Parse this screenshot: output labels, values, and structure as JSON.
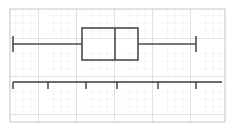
{
  "figure": {
    "kind": "box-and-whisker-plot-on-graph-paper",
    "width": 235,
    "height": 130,
    "background_color": "#ffffff"
  },
  "grid": {
    "minor_color": "#dfe4ea",
    "major_color": "#b9c2cc",
    "minor_step_px": 7.6,
    "major_every": 5,
    "left_px": 10,
    "top_px": 9,
    "right_px": 225,
    "bottom_px": 122,
    "visible": true
  },
  "chart_data": {
    "type": "box",
    "title": "",
    "subtitle": "",
    "xlabel": "",
    "ylabel": "",
    "orientation": "horizontal",
    "grid": true,
    "legend": null,
    "axis": {
      "line_y_px": 82,
      "start_px": 13,
      "end_px": 222,
      "tick_positions_px": [
        13,
        48,
        86,
        117,
        158,
        196
      ],
      "tick_labels": [
        "",
        "",
        "",
        "",
        "",
        ""
      ],
      "tick_length_px": 7,
      "color": "#3a3a3a"
    },
    "series": [
      {
        "name": "box-plot-1",
        "five_number_summary": {
          "minimum_px": 13,
          "q1_px": 82,
          "median_px": 115,
          "q3_px": 138,
          "maximum_px": 196
        },
        "box": {
          "top_px": 28,
          "bottom_px": 60,
          "center_y_px": 44
        },
        "whisker_cap": {
          "top_px": 36,
          "bottom_px": 52
        },
        "stroke_color": "#4a4a50",
        "stroke_width_px": 1.6
      }
    ]
  },
  "elements": {
    "left_whisker_cap": "left-whisker-cap",
    "left_whisker_line": "left-whisker-line",
    "box_rect": "box-rectangle",
    "median_line": "median-line",
    "right_whisker_line": "right-whisker-line",
    "right_whisker_cap": "right-whisker-cap",
    "number_line": "number-line-axis"
  }
}
